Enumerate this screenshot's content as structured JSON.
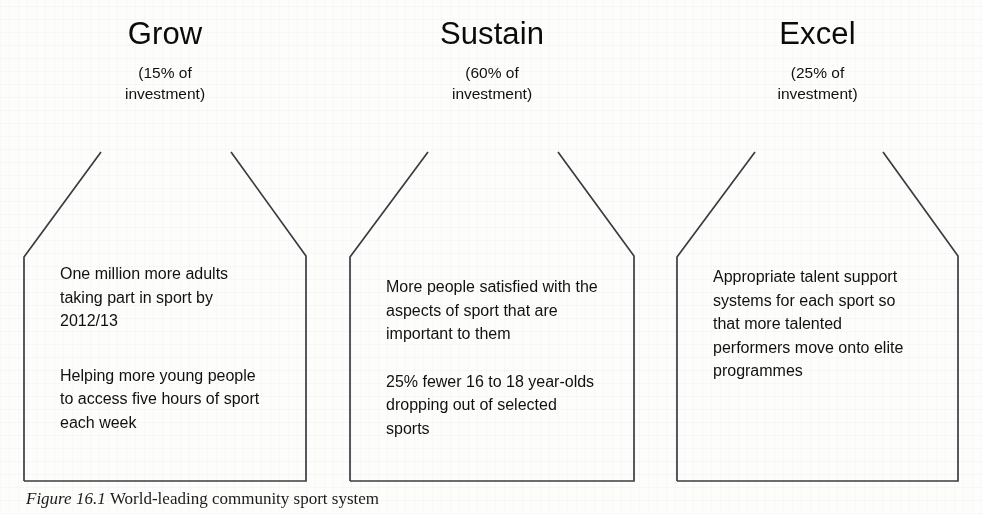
{
  "figure": {
    "caption_label": "Figure 16.1",
    "caption_text": "World-leading community sport system"
  },
  "columns": [
    {
      "id": "grow",
      "title": "Grow",
      "subtitle_line1": "(15% of",
      "subtitle_line2": "investment)",
      "investment_percent": "15%",
      "paragraphs": [
        "One million more adults taking part in sport by 2012/13",
        "Helping more young people to access five hours of sport each week"
      ]
    },
    {
      "id": "sustain",
      "title": "Sustain",
      "subtitle_line1": "(60% of",
      "subtitle_line2": "investment)",
      "investment_percent": "60%",
      "paragraphs": [
        "More people satisfied with the aspects of sport that are important to them",
        "25% fewer 16 to 18 year-olds dropping out of selected sports"
      ]
    },
    {
      "id": "excel",
      "title": "Excel",
      "subtitle_line1": "(25% of",
      "subtitle_line2": "investment)",
      "investment_percent": "25%",
      "paragraphs": [
        "Appropriate talent support systems for each sport so that more talented performers move onto elite programmes"
      ]
    }
  ],
  "style": {
    "outline_color": "#3b3b42",
    "page_background": "#fdfdfc",
    "text_color": "#111111"
  }
}
